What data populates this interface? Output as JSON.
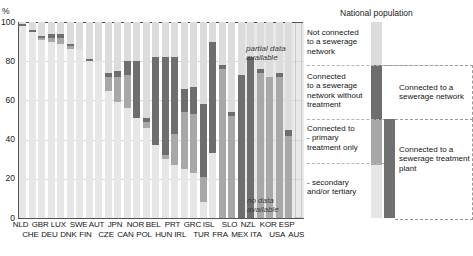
{
  "axis": {
    "y_unit": "%",
    "y_ticks": [
      "100",
      "80",
      "60",
      "40",
      "20",
      "0"
    ],
    "ylim": [
      0,
      100
    ]
  },
  "annotations": {
    "partial_data": "partial data\navailable",
    "partial_data_line1": "partial data",
    "partial_data_line2": "available",
    "no_data_line1": "no data",
    "no_data_line2": "available"
  },
  "legend": {
    "national_population": "National population",
    "items": [
      {
        "key": "not_connected",
        "label": "Not connected\nto a sewerage\nnetwork",
        "color": "#dcdcdc"
      },
      {
        "key": "untreated",
        "label": "Connected\nto a sewerage\nnetwork without\ntreatment",
        "color": "#6e6e6e"
      },
      {
        "key": "primary",
        "label": "Connected to\n- primary\ntreatment only",
        "color": "#a8a8a8"
      },
      {
        "key": "secondary",
        "label": "- secondary\nand/or tertiary",
        "color": "#e6e6e6"
      }
    ],
    "bracket_network": "Connected to a\nsewerage network",
    "bracket_plant": "Connected to a\nsewerage treatment\nplant",
    "l1a": "Not connected",
    "l1b": "to a sewerage",
    "l1c": "network",
    "l2a": "Connected",
    "l2b": "to a sewerage",
    "l2c": "network without",
    "l2d": "treatment",
    "l3a": "Connected to",
    "l3b": "- primary",
    "l3c": "treatment only",
    "l4a": "- secondary",
    "l4b": "and/or tertiary",
    "b1a": "Connected to a",
    "b1b": "sewerage network",
    "b2a": "Connected to a",
    "b2b": "sewerage treatment",
    "b2c": "plant"
  },
  "colors": {
    "not_connected": "#dcdcdc",
    "untreated": "#6e6e6e",
    "primary": "#a8a8a8",
    "secondary": "#e6e6e6",
    "panel": "#e9e9e9",
    "axis": "#555555"
  },
  "chart_data": {
    "type": "bar",
    "title": "",
    "subtitle": "",
    "xlabel": "",
    "ylabel": "%",
    "ylim": [
      0,
      100
    ],
    "grid": true,
    "legend_position": "right",
    "stacked": true,
    "note": "Stacked from top: not connected (light), connected without treatment (dark), primary treatment only (mid), secondary and/or tertiary (very light). Values are percentage of national population.",
    "categories": [
      "NLD",
      "CHE",
      "GBR",
      "DEU",
      "LUX",
      "DNK",
      "SWE",
      "FIN",
      "AUT",
      "CZE",
      "JPN",
      "CAN",
      "NOR",
      "POL",
      "BEL",
      "HUN",
      "PRT",
      "IRL",
      "GRC",
      "TUR",
      "ISL",
      "FRA",
      "SLO",
      "MEX",
      "NZL",
      "ITA",
      "KOR",
      "USA",
      "ESP",
      "AUS"
    ],
    "series": [
      {
        "name": "Connected to a sewerage network - secondary and/or tertiary treatment",
        "key": "secondary",
        "color": "#e6e6e6",
        "values": [
          98,
          95,
          91,
          90,
          89,
          86,
          86,
          80,
          80,
          65,
          59,
          56,
          51,
          46,
          37,
          30,
          27,
          25,
          23,
          8,
          33,
          0,
          0,
          0,
          0,
          0,
          0,
          0,
          0,
          null
        ]
      },
      {
        "name": "Connected to a sewerage network - primary treatment only",
        "key": "primary",
        "color": "#a8a8a8",
        "values": [
          0,
          0,
          1,
          2,
          3,
          2,
          0,
          0,
          0,
          7,
          13,
          17,
          0,
          3,
          0,
          2,
          16,
          29,
          30,
          13,
          0,
          76,
          52,
          0,
          0,
          74,
          72,
          72,
          42,
          null
        ]
      },
      {
        "name": "Connected to a sewerage network without treatment",
        "key": "untreated",
        "color": "#6e6e6e",
        "values": [
          1,
          1,
          1,
          2,
          2,
          1,
          0,
          1,
          0,
          2,
          3,
          7,
          29,
          2,
          45,
          50,
          39,
          12,
          14,
          37,
          57,
          2,
          2,
          73,
          82,
          2,
          0,
          2,
          3,
          null
        ]
      },
      {
        "name": "Not connected to a sewerage network",
        "key": "not_connected",
        "color": "#dcdcdc",
        "values": [
          1,
          4,
          7,
          6,
          6,
          11,
          14,
          19,
          20,
          26,
          25,
          20,
          20,
          49,
          18,
          18,
          18,
          34,
          33,
          42,
          10,
          22,
          46,
          27,
          18,
          24,
          28,
          26,
          55,
          null
        ]
      }
    ],
    "bar_groups": {
      "full_data": [
        "NLD",
        "CHE",
        "GBR",
        "DEU",
        "LUX",
        "DNK",
        "SWE",
        "FIN",
        "AUT",
        "CZE",
        "JPN",
        "CAN",
        "NOR",
        "POL",
        "BEL",
        "HUN",
        "PRT",
        "IRL",
        "GRC",
        "TUR",
        "ISL",
        "FRA",
        "SLO",
        "MEX"
      ],
      "partial_data": [
        "NZL",
        "ITA",
        "KOR",
        "USA",
        "ESP"
      ],
      "no_data": [
        "AUS"
      ]
    },
    "national_population_reference": {
      "not_connected": 22,
      "untreated": 28,
      "primary": 23,
      "secondary": 27
    }
  }
}
